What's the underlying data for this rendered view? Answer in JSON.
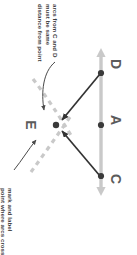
{
  "figure": {
    "background_color": "#ffffff"
  },
  "annotations": [
    {
      "id": "arcs-note",
      "text": "arcs from C and D\nmust be same\ndistance from point",
      "rotation_deg": 90,
      "color": "#3b3b3b",
      "points_to": "E"
    },
    {
      "id": "mark-note",
      "text": "mark and label\npoint where arcs cross",
      "rotation_deg": 90,
      "color": "#3b3b3b",
      "points_to": "E"
    }
  ],
  "point_labels": [
    {
      "id": "D",
      "text": "D",
      "color": "#5b5b5b",
      "rotation_deg": 90
    },
    {
      "id": "A",
      "text": "A",
      "color": "#5b5b5b",
      "rotation_deg": 90
    },
    {
      "id": "C",
      "text": "C",
      "color": "#5b5b5b",
      "rotation_deg": 90
    },
    {
      "id": "E",
      "text": "E",
      "color": "#5b5b5b",
      "rotation_deg": 90
    }
  ],
  "colors": {
    "line_gray": "#c9c9c9",
    "arc_dashed": "#c9c9c9",
    "arrow_dark": "#333333",
    "point_fill": "#3a3a3a",
    "text": "#3b3b3b",
    "label": "#5b5b5b",
    "background": "#ffffff"
  },
  "geometry": {
    "axis_line": {
      "description": "vertical double-headed gray line through C, A, D",
      "x": 101,
      "y_top": 48,
      "y_bottom": 196,
      "arrowheads": [
        "top",
        "bottom"
      ]
    },
    "points": [
      {
        "id": "D",
        "x": 101,
        "y": 73
      },
      {
        "id": "A",
        "x": 101,
        "y": 125
      },
      {
        "id": "C",
        "x": 101,
        "y": 176
      },
      {
        "id": "E",
        "x": 56,
        "y": 125
      }
    ],
    "measure_arrows": [
      {
        "from": "D",
        "to": "E"
      },
      {
        "from": "C",
        "to": "E"
      }
    ],
    "arcs": [
      {
        "center": "C",
        "through": "E",
        "style": "dashed"
      },
      {
        "center": "D",
        "through": "E",
        "style": "dashed"
      }
    ]
  }
}
